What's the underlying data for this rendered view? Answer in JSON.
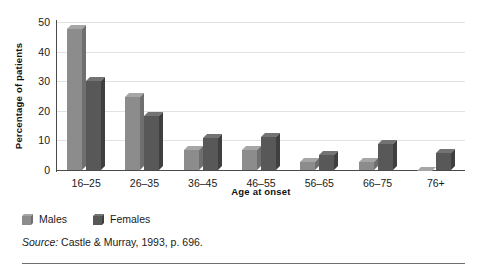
{
  "chart_data": {
    "type": "bar",
    "title": "",
    "xlabel": "Age at onset",
    "ylabel": "Percentage of patients",
    "categories": [
      "16–25",
      "26–35",
      "36–45",
      "46–55",
      "56–65",
      "66–75",
      "76+"
    ],
    "series": [
      {
        "name": "Males",
        "color": "#8c8c8c",
        "values": [
          49,
          26,
          8,
          8,
          4,
          4,
          1
        ]
      },
      {
        "name": "Females",
        "color": "#585858",
        "values": [
          31.5,
          19.5,
          12,
          12.5,
          6.5,
          10,
          7
        ]
      }
    ],
    "ylim": [
      0,
      50
    ],
    "yticks": [
      0,
      10,
      20,
      30,
      40,
      50
    ],
    "ytick_labels": [
      "0",
      "10",
      "20",
      "30",
      "40",
      "50"
    ],
    "grid": "horizontal",
    "legend_position": "below-left",
    "grid_color": "#e2e2e2",
    "axis_color": "#4a4a4a"
  },
  "legend": {
    "items": [
      {
        "label": "Males"
      },
      {
        "label": "Females"
      }
    ]
  },
  "source": {
    "prefix": "Source:",
    "text": " Castle & Murray, 1993, p. 696."
  }
}
